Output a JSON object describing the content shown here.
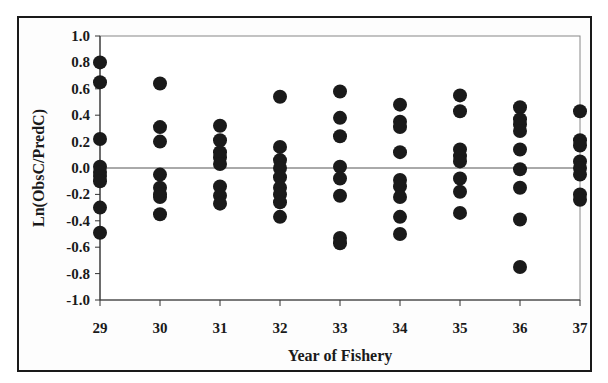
{
  "chart_data": {
    "type": "scatter",
    "title": "",
    "xlabel": "Year of Fishery",
    "ylabel": "Ln(ObsC/PredC)",
    "xlim": [
      29,
      37
    ],
    "ylim": [
      -1.0,
      1.0
    ],
    "x_ticks": [
      "29",
      "30",
      "31",
      "32",
      "33",
      "34",
      "35",
      "36",
      "37"
    ],
    "y_ticks": [
      "1.0",
      "0.8",
      "0.6",
      "0.4",
      "0.2",
      "0.0",
      "-0.2",
      "-0.4",
      "-0.6",
      "-0.8",
      "-1.0"
    ],
    "grid": false,
    "legend": null,
    "reference_line": 0.0,
    "marker_color": "#1a1a1a",
    "series": [
      {
        "name": "residuals",
        "points": [
          {
            "x": 29,
            "values": [
              0.8,
              0.65,
              0.22,
              0.01,
              -0.03,
              -0.06,
              -0.1,
              -0.3,
              -0.49
            ]
          },
          {
            "x": 30,
            "values": [
              0.64,
              0.31,
              0.2,
              -0.05,
              -0.15,
              -0.2,
              -0.22,
              -0.35
            ]
          },
          {
            "x": 31,
            "values": [
              0.32,
              0.21,
              0.12,
              0.08,
              0.03,
              -0.14,
              -0.21,
              -0.27
            ]
          },
          {
            "x": 32,
            "values": [
              0.54,
              0.16,
              0.06,
              0.0,
              -0.07,
              -0.15,
              -0.2,
              -0.26,
              -0.37
            ]
          },
          {
            "x": 33,
            "values": [
              0.58,
              0.38,
              0.24,
              0.01,
              -0.08,
              -0.21,
              -0.53,
              -0.57
            ]
          },
          {
            "x": 34,
            "values": [
              0.48,
              0.35,
              0.31,
              0.12,
              -0.09,
              -0.14,
              -0.22,
              -0.37,
              -0.5
            ]
          },
          {
            "x": 35,
            "values": [
              0.55,
              0.43,
              0.14,
              0.09,
              0.05,
              -0.08,
              -0.18,
              -0.34
            ]
          },
          {
            "x": 36,
            "values": [
              0.46,
              0.37,
              0.33,
              0.28,
              0.14,
              -0.01,
              -0.15,
              -0.39,
              -0.75
            ]
          },
          {
            "x": 37,
            "values": [
              0.43,
              0.21,
              0.17,
              0.05,
              0.0,
              -0.05,
              -0.2,
              -0.24
            ]
          }
        ]
      }
    ]
  }
}
